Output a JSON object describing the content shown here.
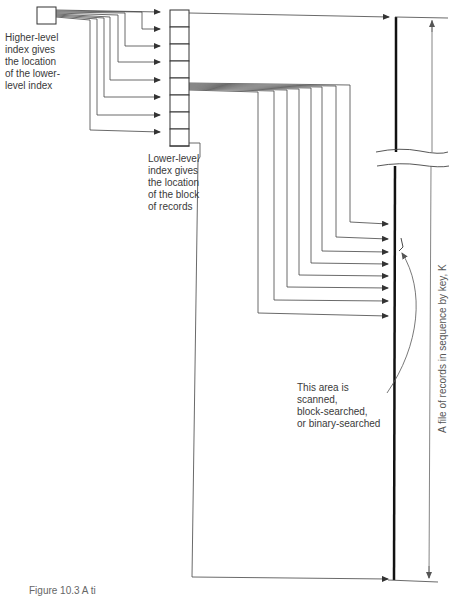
{
  "diagram": {
    "type": "two-level index structure",
    "higher_level_index": {
      "label": "Higher-level\nindex gives\nthe location\nof the lower-\nlevel index",
      "pointer_count": 8
    },
    "lower_level_index": {
      "label": "Lower-level\nindex gives\nthe location\nof the block\nof records",
      "cell_count": 9,
      "pointer_count": 8
    },
    "file": {
      "axis_label": "A file of records in sequence by key, K"
    },
    "search_note": {
      "label": "This area is\nscanned,\nblock-searched,\nor binary-searched"
    },
    "caption": "Figure 10.3  A ti",
    "colors": {
      "line": "#333333",
      "file_line": "#111111",
      "text": "#3a3a3a"
    }
  }
}
